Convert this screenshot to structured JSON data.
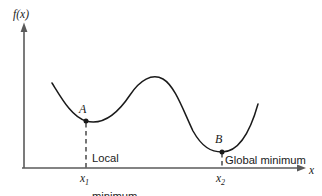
{
  "figure": {
    "type": "function-graph",
    "axes": {
      "y_label": "f(x)",
      "x_label": "x",
      "y_axis_name": "vertical-axis",
      "x_axis_name": "horizontal-axis"
    },
    "points": [
      {
        "id": "A",
        "label": "A",
        "annotation_line1": "Local",
        "annotation_line2": "minimum",
        "tick_label": "x",
        "tick_subscript": "1"
      },
      {
        "id": "B",
        "label": "B",
        "annotation_line1": "Global minimum",
        "annotation_line2": "",
        "tick_label": "x",
        "tick_subscript": "2"
      }
    ],
    "colors": {
      "curve": "#1a1a1a",
      "axis": "#5a5a5a",
      "text": "#1a1a1a",
      "background": "#ffffff"
    }
  },
  "chart_data": {
    "type": "line",
    "title": "",
    "xlabel": "x",
    "ylabel": "f(x)",
    "grid": false,
    "legend": null,
    "xlim": [
      0,
      322
    ],
    "ylim": [
      0,
      196
    ],
    "annotations": [
      {
        "text": "A",
        "x": 86,
        "y": 121
      },
      {
        "text": "Local minimum",
        "x": 92,
        "y": 133
      },
      {
        "text": "B",
        "x": 222,
        "y": 152
      },
      {
        "text": "Global minimum",
        "x": 224,
        "y": 163
      },
      {
        "text": "x1",
        "x": 86,
        "y": 182
      },
      {
        "text": "x2",
        "x": 222,
        "y": 182
      }
    ],
    "series": [
      {
        "name": "f(x)",
        "path": "M 52 83 C 62 99, 72 117, 86 121 C 104 126, 118 113, 130 95 C 140 80, 152 73, 163 79 C 175 86, 183 110, 193 131 C 202 147, 211 152, 222 152 C 237 152, 249 136, 258 104"
      }
    ]
  }
}
